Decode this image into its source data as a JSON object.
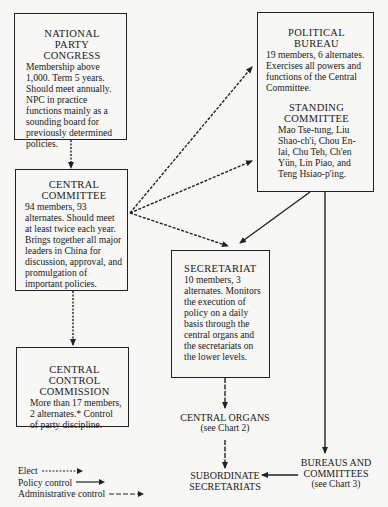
{
  "diagram": {
    "type": "org-chart",
    "nodes": {
      "npc": {
        "title_line1": "NATIONAL PARTY",
        "title_line2": "CONGRESS",
        "body": "Membership above 1,000. Term 5 years. Should meet annually. NPC in practice functions mainly as a sounding board for previously determined policies."
      },
      "politburo": {
        "title": "POLITICAL BUREAU",
        "body": "19 members, 6 alternates. Exercises all powers and functions of the Central Committee.",
        "sub_title_line1": "STANDING",
        "sub_title_line2": "COMMITTEE",
        "sub_body": "Mao Tse-tung, Liu Shao-ch'i, Chou En-lai, Chu Teh, Ch'en Yün, Lin Piao, and Teng Hsiao-p'ing."
      },
      "central_committee": {
        "title_line1": "CENTRAL",
        "title_line2": "COMMITTEE",
        "body": "94 members, 93 alternates. Should meet at least twice each year. Brings together all major leaders in China for discussion, approval, and promulgation of important policies."
      },
      "secretariat": {
        "title": "SECRETARIAT",
        "body": "10 members, 3 alternates. Monitors the execution of policy on a daily basis through the central organs and the secretariats on the lower levels."
      },
      "central_control_commission": {
        "title_line1": "CENTRAL CONTROL",
        "title_line2": "COMMISSION",
        "body": "More than 17 members, 2 alternates.* Control of party discipline."
      },
      "central_organs": {
        "title": "CENTRAL ORGANS",
        "sub": "(see Chart 2)"
      },
      "subordinate_secretariats": {
        "title_line1": "SUBORDINATE",
        "title_line2": "SECRETARIATS"
      },
      "bureaus_committees": {
        "title_line1": "BUREAUS AND",
        "title_line2": "COMMITTEES",
        "sub": "(see Chart 3)"
      }
    },
    "edges": [
      {
        "from": "National Party Congress",
        "to": "Central Committee",
        "kind": "Elect"
      },
      {
        "from": "Central Committee",
        "to": "Political Bureau",
        "kind": "Elect"
      },
      {
        "from": "Central Committee",
        "to": "Political Bureau (Standing Committee)",
        "kind": "Elect"
      },
      {
        "from": "Central Committee",
        "to": "Secretariat",
        "kind": "Elect"
      },
      {
        "from": "Central Committee",
        "to": "Central Control Commission",
        "kind": "Elect"
      },
      {
        "from": "Political Bureau",
        "to": "Secretariat",
        "kind": "Policy control"
      },
      {
        "from": "Political Bureau",
        "to": "Bureaus and Committees",
        "kind": "Policy control"
      },
      {
        "from": "Secretariat",
        "to": "Central Organs",
        "kind": "Administrative control"
      },
      {
        "from": "Central Organs",
        "to": "Subordinate Secretariats",
        "kind": "Administrative control"
      },
      {
        "from": "Bureaus and Committees",
        "to": "Subordinate Secretariats",
        "kind": "Policy control"
      }
    ],
    "legend": {
      "elect": "Elect",
      "policy": "Policy control",
      "admin": "Administrative control"
    }
  }
}
